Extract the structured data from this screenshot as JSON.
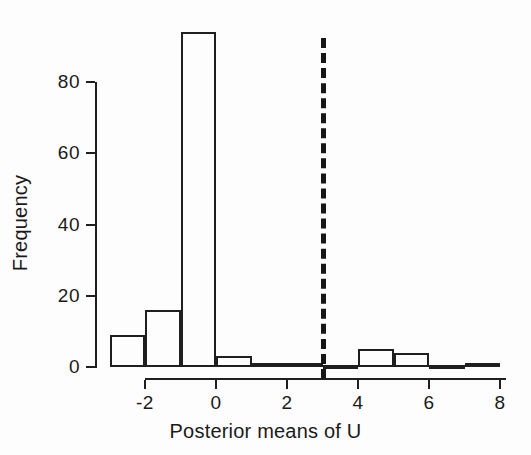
{
  "chart_data": {
    "type": "bar",
    "title": "",
    "subtitle": "",
    "xlabel": "Posterior means of U",
    "ylabel": "Frequency",
    "xlim": [
      -3,
      8
    ],
    "ylim": [
      0,
      95
    ],
    "grid": false,
    "legend": "none",
    "bin_width": 1,
    "bin_edges": [
      -3,
      -2,
      -1,
      0,
      1,
      2,
      3,
      4,
      5,
      6,
      7,
      8
    ],
    "categories": [
      "-3 to -2",
      "-2 to -1",
      "-1 to 0",
      "0 to 1",
      "1 to 2",
      "2 to 3",
      "3 to 4",
      "4 to 5",
      "5 to 6",
      "6 to 7",
      "7 to 8"
    ],
    "values": [
      9,
      16,
      94,
      3,
      1,
      1,
      0,
      5,
      4,
      0,
      1
    ],
    "xticks": [
      -2,
      0,
      2,
      4,
      6,
      8
    ],
    "xtick_labels": [
      "-2",
      "0",
      "2",
      "4",
      "6",
      "8"
    ],
    "yticks": [
      0,
      20,
      40,
      60,
      80
    ],
    "ytick_labels": [
      "0",
      "20",
      "40",
      "60",
      "80"
    ],
    "annotations": [
      {
        "name": "reference-line",
        "type": "vertical-dashed-line",
        "x": 3,
        "color": "#161616"
      }
    ],
    "colors": {
      "bar_edge": "#1f1f1f",
      "bar_fill": "transparent",
      "axis": "#1f1f1f",
      "text": "#1a1a1a",
      "background": "#fdfdfd"
    }
  }
}
